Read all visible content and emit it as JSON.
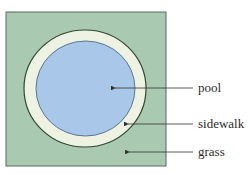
{
  "diagram": {
    "colors": {
      "grass": "#a9c9b0",
      "grass_border": "#5a6a60",
      "sidewalk": "#eef2e2",
      "sidewalk_border": "#2f4a34",
      "pool": "#a9c7e8",
      "pool_border": "#3f5f7f",
      "arrow": "#333333"
    },
    "labels": {
      "pool": "pool",
      "sidewalk": "sidewalk",
      "grass": "grass"
    }
  }
}
